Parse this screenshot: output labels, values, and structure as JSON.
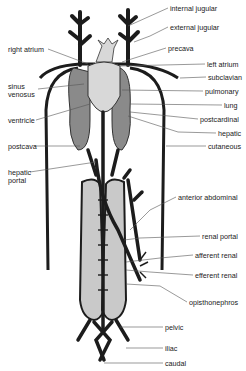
{
  "diagram": {
    "labels_right": [
      {
        "id": "internal-jugular",
        "text": "internal jugular",
        "x": 170,
        "y": 5
      },
      {
        "id": "external-jugular",
        "text": "external jugular",
        "x": 170,
        "y": 24
      },
      {
        "id": "precava",
        "text": "precava",
        "x": 168,
        "y": 45
      },
      {
        "id": "left-atrium",
        "text": "left atrium",
        "x": 207,
        "y": 61
      },
      {
        "id": "subclavian",
        "text": "subclavian",
        "x": 208,
        "y": 74
      },
      {
        "id": "pulmonary",
        "text": "pulmonary",
        "x": 205,
        "y": 88
      },
      {
        "id": "lung",
        "text": "lung",
        "x": 224,
        "y": 102
      },
      {
        "id": "postcardinal",
        "text": "postcardinal",
        "x": 200,
        "y": 116
      },
      {
        "id": "hepatic",
        "text": "hepatic",
        "x": 218,
        "y": 130
      },
      {
        "id": "cutaneous",
        "text": "cutaneous",
        "x": 208,
        "y": 143
      },
      {
        "id": "anterior-abdominal",
        "text": "anterior abdominal",
        "x": 178,
        "y": 194
      },
      {
        "id": "renal-portal",
        "text": "renal portal",
        "x": 202,
        "y": 233
      },
      {
        "id": "afferent-renal",
        "text": "afferent renal",
        "x": 195,
        "y": 252
      },
      {
        "id": "efferent-renal",
        "text": "efferent renal",
        "x": 195,
        "y": 272
      },
      {
        "id": "opisthonephros",
        "text": "opisthonephros",
        "x": 189,
        "y": 299
      },
      {
        "id": "pelvic",
        "text": "pelvic",
        "x": 165,
        "y": 324
      },
      {
        "id": "iliac",
        "text": "iliac",
        "x": 165,
        "y": 345
      },
      {
        "id": "caudal",
        "text": "caudal",
        "x": 165,
        "y": 360
      }
    ],
    "labels_left": [
      {
        "id": "right-atrium",
        "text": "right atrium",
        "x": 8,
        "y": 46
      },
      {
        "id": "sinus-venosus",
        "text": "sinus\nvenosus",
        "x": 8,
        "y": 83
      },
      {
        "id": "ventricle",
        "text": "ventricle",
        "x": 8,
        "y": 117
      },
      {
        "id": "postcava",
        "text": "postcava",
        "x": 8,
        "y": 143
      },
      {
        "id": "hepatic-portal",
        "text": "hepatic\nportal",
        "x": 8,
        "y": 169
      }
    ],
    "colors": {
      "vessel": "#1c1c1c",
      "organ": "#8a8a8a",
      "kidney": "#c9c9c9",
      "heart": "#d8d8d8",
      "leader": "#555555"
    }
  }
}
